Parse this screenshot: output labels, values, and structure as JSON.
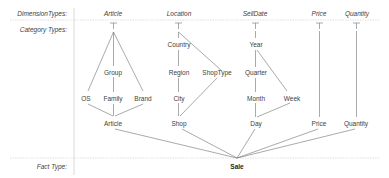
{
  "rows": {
    "dimension_types": "DimensionTypes:",
    "category_types": "Category Types:",
    "fact_type": "Fact Type:"
  },
  "dimensions": {
    "article": "Article",
    "location": "Location",
    "selldate": "SellDate",
    "price": "Price",
    "quantity": "Quantity"
  },
  "categories": {
    "group": "Group",
    "os": "OS",
    "family": "Family",
    "brand": "Brand",
    "article": "Article",
    "country": "Country",
    "region": "Region",
    "shoptype": "ShopType",
    "city": "City",
    "shop": "Shop",
    "year": "Year",
    "quarter": "Quarter",
    "month": "Month",
    "week": "Week",
    "day": "Day",
    "price": "Price",
    "quantity": "Quantity"
  },
  "fact": {
    "sale": "Sale"
  }
}
